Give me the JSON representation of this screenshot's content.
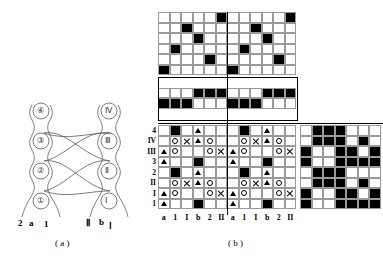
{
  "figure": {
    "captions": {
      "a": "( a )",
      "b": "( b )"
    }
  },
  "panel_a": {
    "name": "braid-diagram",
    "left_nodes": [
      "④",
      "③",
      "②",
      "①"
    ],
    "right_nodes": [
      "Ⅳ",
      "Ⅲ",
      "Ⅱ",
      "Ⅰ"
    ],
    "left_foot_labels": [
      "2",
      "a",
      "1"
    ],
    "right_foot_labels": [
      "Ⅱ",
      "b",
      "Ⅰ"
    ],
    "stroke_color": "#555555"
  },
  "panel_b": {
    "name": "matrix-diagram",
    "row_labels": [
      "4",
      "IV",
      "III",
      "3",
      "2",
      "II",
      "I",
      "1"
    ],
    "column_labels": [
      "a",
      "1",
      "I",
      "b",
      "2",
      "II",
      "a",
      "1",
      "I",
      "b",
      "2",
      "II"
    ],
    "legend": {
      "black": "filled-cell",
      "circle": "o",
      "triangle": "▲",
      "cross": "×"
    },
    "top_block": {
      "name": "top-permutation-block",
      "rows": 6,
      "cols": 12,
      "comment": "two 6x6 anti-diagonal permutation blocks side by side",
      "cells": [
        [
          0,
          0,
          0,
          0,
          0,
          1,
          0,
          0,
          0,
          0,
          0,
          1
        ],
        [
          0,
          0,
          1,
          0,
          0,
          0,
          0,
          0,
          1,
          0,
          0,
          0
        ],
        [
          0,
          0,
          0,
          1,
          0,
          0,
          0,
          0,
          0,
          1,
          0,
          0
        ],
        [
          0,
          1,
          0,
          0,
          0,
          0,
          0,
          1,
          0,
          0,
          0,
          0
        ],
        [
          0,
          0,
          0,
          0,
          1,
          0,
          0,
          0,
          0,
          0,
          1,
          0
        ],
        [
          1,
          0,
          0,
          0,
          0,
          0,
          1,
          0,
          0,
          0,
          0,
          0
        ]
      ]
    },
    "middle_block": {
      "name": "middle-band-block",
      "rows": 4,
      "cols": 12,
      "cells": [
        [
          0,
          0,
          0,
          0,
          0,
          0,
          0,
          0,
          0,
          0,
          0,
          0
        ],
        [
          0,
          0,
          0,
          1,
          1,
          1,
          0,
          0,
          0,
          1,
          1,
          1
        ],
        [
          1,
          1,
          1,
          0,
          0,
          0,
          1,
          1,
          1,
          0,
          0,
          0
        ],
        [
          0,
          0,
          0,
          0,
          0,
          0,
          0,
          0,
          0,
          0,
          0,
          0
        ]
      ],
      "borders": false
    },
    "bottom_block": {
      "name": "bottom-symbol-block",
      "rows": 8,
      "cols": 12,
      "cells": [
        [
          "",
          "K",
          "",
          "T",
          "",
          "",
          "",
          "K",
          "",
          "T",
          "",
          ""
        ],
        [
          "",
          "O",
          "X",
          "T",
          "O",
          "",
          "",
          "O",
          "X",
          "T",
          "O",
          ""
        ],
        [
          "T",
          "O",
          "",
          "",
          "O",
          "X",
          "T",
          "O",
          "",
          "",
          "O",
          "X"
        ],
        [
          "T",
          "",
          "",
          "K",
          "",
          "",
          "T",
          "",
          "",
          "K",
          "",
          ""
        ],
        [
          "",
          "K",
          "",
          "T",
          "",
          "",
          "",
          "K",
          "",
          "T",
          "",
          ""
        ],
        [
          "",
          "O",
          "X",
          "T",
          "O",
          "",
          "",
          "O",
          "X",
          "T",
          "O",
          ""
        ],
        [
          "T",
          "O",
          "",
          "",
          "O",
          "X",
          "T",
          "O",
          "",
          "",
          "O",
          "X"
        ],
        [
          "T",
          "",
          "",
          "K",
          "",
          "",
          "T",
          "",
          "",
          "K",
          "",
          ""
        ]
      ]
    },
    "right_block": {
      "name": "right-dense-block",
      "rows": 8,
      "cols": 7,
      "cells": [
        [
          0,
          1,
          1,
          1,
          0,
          0,
          0
        ],
        [
          0,
          1,
          1,
          1,
          0,
          1,
          0
        ],
        [
          1,
          0,
          0,
          1,
          1,
          0,
          1
        ],
        [
          1,
          0,
          0,
          1,
          1,
          1,
          1
        ],
        [
          0,
          1,
          1,
          1,
          0,
          0,
          0
        ],
        [
          0,
          1,
          1,
          1,
          0,
          1,
          0
        ],
        [
          1,
          0,
          0,
          1,
          1,
          0,
          1
        ],
        [
          1,
          0,
          0,
          1,
          1,
          1,
          1
        ]
      ]
    }
  }
}
